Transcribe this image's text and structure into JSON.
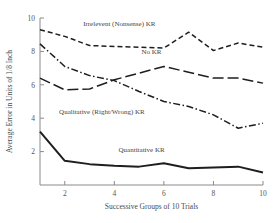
{
  "chart_data": {
    "type": "line",
    "title": "",
    "xlabel": "Successive Groups of 10 Trials",
    "ylabel": "Average Error in Units of 1/8 Inch",
    "x": [
      1,
      2,
      3,
      4,
      5,
      6,
      7,
      8,
      9,
      10
    ],
    "xlim": [
      1,
      10
    ],
    "ylim": [
      0,
      10
    ],
    "xticks": [
      2,
      4,
      6,
      8,
      10
    ],
    "yticks": [
      2,
      4,
      6,
      8,
      10
    ],
    "xtick_labels": [
      "2",
      "4",
      "6",
      "8",
      "10"
    ],
    "ytick_labels": [
      "2",
      "4",
      "6",
      "8",
      "10"
    ],
    "grid": false,
    "legend_position": "inline-annotations",
    "series": [
      {
        "name": "Irrelevent (Nonsense) KR",
        "label": "Irrelevent (Nonsense) KR",
        "style": "dashed",
        "dasharray": "5,3",
        "values": [
          9.3,
          8.9,
          8.35,
          8.3,
          8.25,
          8.2,
          9.15,
          8.05,
          8.5,
          8.25
        ],
        "label_x": 4.2,
        "label_y": 9.55
      },
      {
        "name": "No KR",
        "label": "No KR",
        "style": "long-dash",
        "dasharray": "11,4",
        "values": [
          6.4,
          5.7,
          5.75,
          6.3,
          6.7,
          7.1,
          6.75,
          6.4,
          6.4,
          6.1
        ],
        "label_x": 5.5,
        "label_y": 7.85
      },
      {
        "name": "Qualitative (Right/Wrong) KR",
        "label": "Qualitative (Right/Wrong) KR",
        "style": "dash-dot",
        "dasharray": "7,2.5,1.5,2.5",
        "values": [
          8.45,
          7.1,
          6.55,
          6.25,
          5.6,
          5.0,
          4.7,
          4.2,
          3.4,
          3.7
        ],
        "label_x": 3.5,
        "label_y": 4.25
      },
      {
        "name": "Quantitative KR",
        "label": "Quantitative KR",
        "style": "solid",
        "dasharray": "none",
        "values": [
          3.2,
          1.45,
          1.25,
          1.15,
          1.1,
          1.3,
          1.0,
          1.05,
          1.1,
          0.75
        ],
        "label_x": 5.1,
        "label_y": 2.0
      }
    ]
  }
}
